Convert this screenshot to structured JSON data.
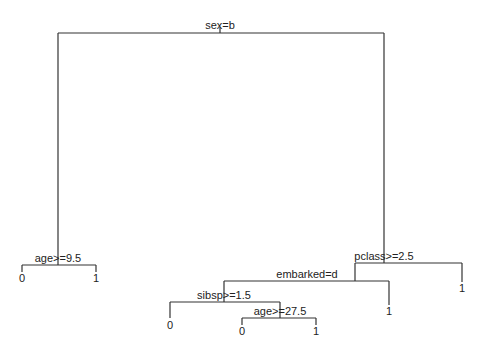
{
  "diagram": {
    "type": "decision-tree",
    "colors": {
      "line": "#333333",
      "text": "#222222",
      "background": "#ffffff"
    },
    "nodes": {
      "root": {
        "split": "sex=b",
        "x": 220,
        "y": 33
      },
      "age1": {
        "split": "age>=9.5",
        "x": 58,
        "y": 265
      },
      "pclass": {
        "split": "pclass>=2.5",
        "x": 384,
        "y": 263
      },
      "embarked": {
        "split": "embarked=d",
        "x": 355,
        "y": 281
      },
      "sibsp": {
        "split": "sibsp>=1.5",
        "x": 224,
        "y": 302
      },
      "age2": {
        "split": "age>=27.5",
        "x": 280,
        "y": 318
      }
    },
    "leaves": {
      "age1_left": "0",
      "age1_right": "1",
      "pclass_right": "1",
      "embarked_right": "1",
      "sibsp_left": "0",
      "age2_left": "0",
      "age2_right": "1"
    }
  }
}
